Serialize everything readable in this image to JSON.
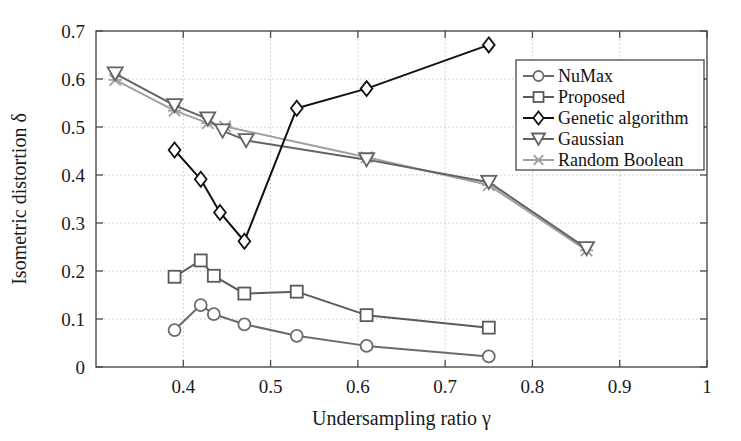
{
  "chart_data": {
    "type": "line",
    "title": "",
    "xlabel": "Undersampling ratio γ",
    "ylabel": "Isometric distortion δ",
    "xlim": [
      0.3,
      1.0
    ],
    "ylim": [
      0.0,
      0.7
    ],
    "grid": true,
    "legend_position": "right-upper-inside",
    "xticks": [
      0.4,
      0.5,
      0.6,
      0.7,
      0.8,
      0.9,
      1.0
    ],
    "xtick_labels": [
      "0.4",
      "0.5",
      "0.6",
      "0.7",
      "0.8",
      "0.9",
      "1"
    ],
    "yticks": [
      0,
      0.1,
      0.2,
      0.3,
      0.4,
      0.5,
      0.6,
      0.7
    ],
    "ytick_labels": [
      "0",
      "0.1",
      "0.2",
      "0.3",
      "0.4",
      "0.5",
      "0.6",
      "0.7"
    ],
    "series": [
      {
        "name": "NuMax",
        "marker": "circle",
        "color": "#6b6b6b",
        "x": [
          0.39,
          0.42,
          0.435,
          0.47,
          0.53,
          0.61,
          0.75
        ],
        "y": [
          0.077,
          0.129,
          0.11,
          0.089,
          0.065,
          0.044,
          0.022
        ]
      },
      {
        "name": "Proposed",
        "marker": "square",
        "color": "#5a5a5a",
        "x": [
          0.39,
          0.42,
          0.435,
          0.47,
          0.53,
          0.61,
          0.75
        ],
        "y": [
          0.188,
          0.222,
          0.19,
          0.153,
          0.157,
          0.108,
          0.082
        ]
      },
      {
        "name": "Genetic algorithm",
        "marker": "diamond",
        "color": "#111111",
        "x": [
          0.39,
          0.42,
          0.442,
          0.47,
          0.53,
          0.61,
          0.75
        ],
        "y": [
          0.452,
          0.391,
          0.322,
          0.262,
          0.539,
          0.58,
          0.671
        ]
      },
      {
        "name": "Gaussian",
        "marker": "triangle-down",
        "color": "#636363",
        "x": [
          0.322,
          0.39,
          0.428,
          0.445,
          0.472,
          0.61,
          0.75,
          0.862
        ],
        "y": [
          0.611,
          0.545,
          0.517,
          0.492,
          0.472,
          0.432,
          0.385,
          0.247
        ]
      },
      {
        "name": "Random Boolean",
        "marker": "x",
        "color": "#a0a0a0",
        "x": [
          0.322,
          0.39,
          0.428,
          0.448,
          0.61,
          0.75,
          0.862
        ],
        "y": [
          0.598,
          0.534,
          0.508,
          0.501,
          0.437,
          0.379,
          0.243
        ]
      }
    ]
  },
  "legend": {
    "items": [
      {
        "label": "NuMax"
      },
      {
        "label": "Proposed"
      },
      {
        "label": "Genetic algorithm"
      },
      {
        "label": "Gaussian"
      },
      {
        "label": "Random Boolean"
      }
    ]
  }
}
